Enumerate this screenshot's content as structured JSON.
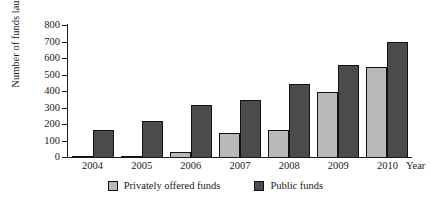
{
  "figure": {
    "top_caption_partial": "",
    "background_color": "#ffffff"
  },
  "chart_data": {
    "type": "bar",
    "title": "",
    "xlabel": "Year",
    "ylabel": "Number of funds launched",
    "categories": [
      "2004",
      "2005",
      "2006",
      "2007",
      "2008",
      "2009",
      "2010"
    ],
    "series": [
      {
        "name": "Privately offered funds",
        "color": "#b9b9b9",
        "values": [
          3,
          5,
          30,
          145,
          165,
          395,
          545
        ]
      },
      {
        "name": "Public funds",
        "color": "#4b4b4b",
        "values": [
          165,
          220,
          315,
          345,
          440,
          555,
          700
        ]
      }
    ],
    "ylim": [
      0,
      800
    ],
    "ytick_labels": [
      "800",
      "700",
      "600",
      "500",
      "400",
      "300",
      "200",
      "100",
      "0"
    ],
    "ytick_values": [
      800,
      700,
      600,
      500,
      400,
      300,
      200,
      100,
      0
    ],
    "grid": false,
    "legend_position": "bottom"
  },
  "legend": {
    "items": [
      {
        "label": "Privately offered funds",
        "color": "#b9b9b9"
      },
      {
        "label": "Public funds",
        "color": "#4b4b4b"
      }
    ]
  }
}
